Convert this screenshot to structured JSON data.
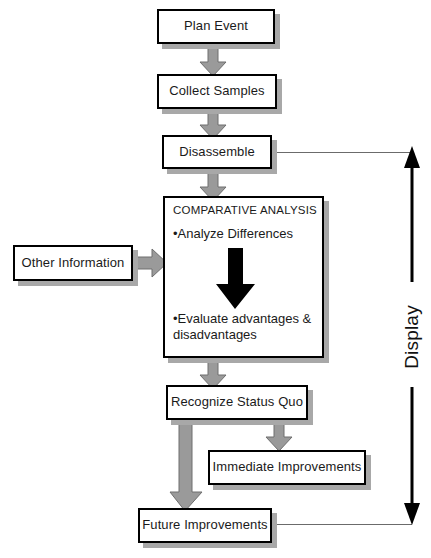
{
  "diagram": {
    "nodes": {
      "plan_event": "Plan Event",
      "collect_samples": "Collect Samples",
      "disassemble": "Disassemble",
      "other_information": "Other Information",
      "recognize_status_quo": "Recognize Status Quo",
      "immediate_improvements": "Immediate Improvements",
      "future_improvements": "Future Improvements"
    },
    "comparative_analysis": {
      "title": "COMPARATIVE ANALYSIS",
      "bullet_1": "•Analyze Differences",
      "bullet_2": "•Evaluate advantages & disadvantages"
    },
    "annotation": {
      "display_label": "Display"
    },
    "colors": {
      "box_border": "#000000",
      "box_fill": "#ffffff",
      "box_shadow": "#a8a8a8",
      "arrow_fill": "#9a9a9a",
      "arrow_edge": "#6e6e6e",
      "black_arrow": "#000000",
      "line": "#6b6b6b",
      "text": "#1a1a1a"
    }
  }
}
